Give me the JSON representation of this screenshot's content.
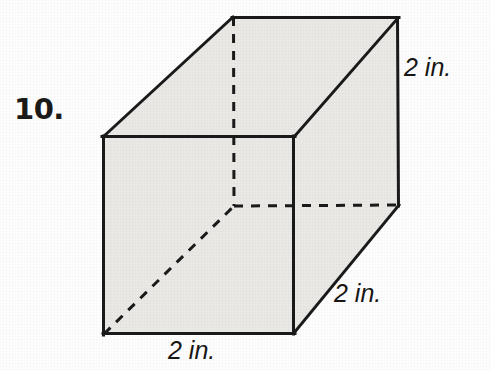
{
  "page": {
    "background_color": "#fefefe",
    "figure_type": "rectangular-prism",
    "problem_number": "10."
  },
  "figure": {
    "name": "cube-diagram",
    "face_fill_color": "#eae9e6",
    "edge_color": "#1a1a1a",
    "hidden_edge_style": "dashed",
    "labels": {
      "height": "2 in.",
      "depth": "2 in.",
      "width": "2 in."
    },
    "vertices": {
      "front_top_left": [
        103,
        137
      ],
      "front_top_right": [
        294,
        137
      ],
      "front_bottom_right": [
        294,
        333
      ],
      "front_bottom_left": [
        104,
        334
      ],
      "back_top_left": [
        233,
        17
      ],
      "back_top_right": [
        398,
        18
      ],
      "back_bottom_right": [
        399,
        205
      ],
      "back_bottom_left": [
        234,
        206
      ]
    }
  },
  "dimensions": {
    "length": 2,
    "width": 2,
    "height": 2,
    "unit": "in."
  }
}
